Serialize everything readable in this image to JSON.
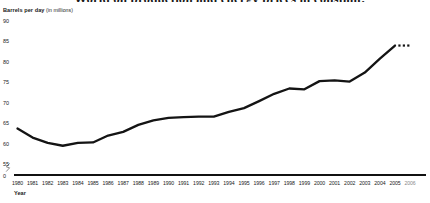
{
  "chart_data": {
    "type": "line",
    "title": "World oil production and energy prices in constant.",
    "ylabel_main": "Barrels per day",
    "ylabel_unit": "(in millions)",
    "xlabel": "Year",
    "ylim": [
      55,
      90
    ],
    "ytick_labels": [
      "90",
      "85",
      "80",
      "75",
      "70",
      "65",
      "60",
      "55",
      "0"
    ],
    "ytick_values": [
      90,
      85,
      80,
      75,
      70,
      65,
      60,
      55,
      0
    ],
    "axis_break": true,
    "axis_break_symbol": "zig-zag",
    "grid": false,
    "legend": "none",
    "line_color": "#141414",
    "categories": [
      "1980",
      "1981",
      "1982",
      "1983",
      "1984",
      "1985",
      "1986",
      "1987",
      "1988",
      "1989",
      "1990",
      "1991",
      "1992",
      "1993",
      "1994",
      "1995",
      "1996",
      "1997",
      "1998",
      "1999",
      "2000",
      "2001",
      "2002",
      "2003",
      "2004",
      "2005",
      "2006"
    ],
    "x": [
      1980,
      1981,
      1982,
      1983,
      1984,
      1985,
      1986,
      1987,
      1988,
      1989,
      1990,
      1991,
      1992,
      1993,
      1994,
      1995,
      1996,
      1997,
      1998,
      1999,
      2000,
      2001,
      2002,
      2003,
      2004,
      2005,
      2006
    ],
    "values": [
      63.7,
      61.5,
      60.2,
      59.5,
      60.2,
      60.3,
      62.0,
      62.9,
      64.6,
      65.7,
      66.3,
      66.5,
      66.6,
      66.6,
      67.8,
      68.7,
      70.4,
      72.2,
      73.5,
      73.3,
      75.3,
      75.5,
      75.2,
      77.4,
      80.8,
      84.0,
      84.0
    ],
    "projection_from": 2005,
    "projection_style": "dotted",
    "projection_values": [
      84.0,
      84.0
    ],
    "series": [
      {
        "name": "World oil production",
        "values": [
          63.7,
          61.5,
          60.2,
          59.5,
          60.2,
          60.3,
          62.0,
          62.9,
          64.6,
          65.7,
          66.3,
          66.5,
          66.6,
          66.6,
          67.8,
          68.7,
          70.4,
          72.2,
          73.5,
          73.3,
          75.3,
          75.5,
          75.2,
          77.4,
          80.8,
          84.0,
          84.0
        ]
      }
    ]
  }
}
